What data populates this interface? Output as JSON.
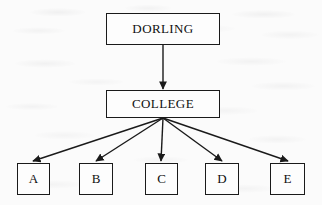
{
  "diagram": {
    "type": "hierarchy-tree",
    "title_text": "",
    "ink_color": "#1a1a1a",
    "paper_color": "#fbfbfb",
    "root": {
      "label": "DORLING",
      "x": 106,
      "y": 13,
      "w": 114,
      "h": 32
    },
    "middle": {
      "label": "COLLEGE",
      "x": 106,
      "y": 90,
      "w": 114,
      "h": 28
    },
    "leaves": [
      {
        "label": "A",
        "x": 17,
        "y": 163,
        "w": 33,
        "h": 32
      },
      {
        "label": "B",
        "x": 79,
        "y": 163,
        "w": 34,
        "h": 32
      },
      {
        "label": "C",
        "x": 145,
        "y": 163,
        "w": 33,
        "h": 32
      },
      {
        "label": "D",
        "x": 205,
        "y": 163,
        "w": 34,
        "h": 32
      },
      {
        "label": "E",
        "x": 270,
        "y": 163,
        "w": 35,
        "h": 32
      }
    ],
    "edges": [
      {
        "from": "DORLING",
        "to": "COLLEGE",
        "x1": 163,
        "y1": 45,
        "x2": 163,
        "y2": 89
      },
      {
        "from": "COLLEGE",
        "to": "A",
        "x1": 163,
        "y1": 118,
        "x2": 33,
        "y2": 162
      },
      {
        "from": "COLLEGE",
        "to": "B",
        "x1": 163,
        "y1": 118,
        "x2": 96,
        "y2": 162
      },
      {
        "from": "COLLEGE",
        "to": "C",
        "x1": 163,
        "y1": 118,
        "x2": 161,
        "y2": 162
      },
      {
        "from": "COLLEGE",
        "to": "D",
        "x1": 163,
        "y1": 118,
        "x2": 222,
        "y2": 162
      },
      {
        "from": "COLLEGE",
        "to": "E",
        "x1": 163,
        "y1": 118,
        "x2": 288,
        "y2": 162
      }
    ]
  }
}
